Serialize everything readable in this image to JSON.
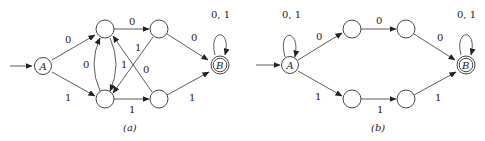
{
  "diagram_a": {
    "caption": "(a)",
    "start_state": "A",
    "accept_state": "B",
    "edges": [
      {
        "from": "A",
        "to": "q1",
        "label": "0"
      },
      {
        "from": "A",
        "to": "q2",
        "label": "1"
      },
      {
        "from": "q1",
        "to": "q3",
        "label": "0"
      },
      {
        "from": "q2",
        "to": "q1",
        "label": "0"
      },
      {
        "from": "q1",
        "to": "q2",
        "label": "1"
      },
      {
        "from": "q3",
        "to": "q2",
        "label": "1"
      },
      {
        "from": "q4",
        "to": "q1",
        "label": "0"
      },
      {
        "from": "q2",
        "to": "q4",
        "label": "1"
      },
      {
        "from": "q3",
        "to": "B",
        "label": "0"
      },
      {
        "from": "q4",
        "to": "B",
        "label": "1"
      },
      {
        "from": "B",
        "to": "B",
        "label": "0, 1"
      }
    ]
  },
  "diagram_b": {
    "caption": "(b)",
    "start_state": "A",
    "accept_state": "B",
    "edges": [
      {
        "from": "A",
        "to": "A",
        "label": "0, 1"
      },
      {
        "from": "A",
        "to": "p1",
        "label": "0"
      },
      {
        "from": "p1",
        "to": "p2",
        "label": "0"
      },
      {
        "from": "p2",
        "to": "B",
        "label": "0"
      },
      {
        "from": "A",
        "to": "p3",
        "label": "1"
      },
      {
        "from": "p3",
        "to": "p4",
        "label": "1"
      },
      {
        "from": "p4",
        "to": "B",
        "label": "1"
      },
      {
        "from": "B",
        "to": "B",
        "label": "0, 1"
      }
    ]
  }
}
